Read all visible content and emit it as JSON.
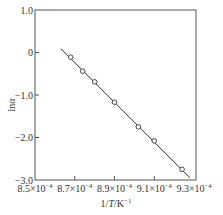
{
  "chart_data": {
    "type": "scatter",
    "title": "",
    "xlabel": "1/T/K⁻¹",
    "ylabel": "lnα",
    "xlim": [
      0.00085,
      0.00093
    ],
    "ylim": [
      -3.0,
      1.0
    ],
    "grid": false,
    "legend": null,
    "x_ticks": [
      0.00085,
      0.00087,
      0.00089,
      0.00091,
      0.00093
    ],
    "x_tick_labels": [
      "8.5×10⁻⁴",
      "8.7×10⁻⁴",
      "8.9×10⁻⁴",
      "9.1×10⁻⁴",
      "9.3×10⁻⁴"
    ],
    "y_ticks": [
      1.0,
      0,
      -1.0,
      -2.0,
      -3.0
    ],
    "y_tick_labels": [
      "1.0",
      "0",
      "−1.0",
      "−2.0",
      "−3.0"
    ],
    "series": [
      {
        "name": "data",
        "marker": "open-circle",
        "x": [
          0.000868,
          0.000874,
          0.00088,
          0.00089,
          0.000902,
          0.00091,
          0.000924
        ],
        "y": [
          -0.11,
          -0.44,
          -0.69,
          -1.17,
          -1.75,
          -2.08,
          -2.75
        ]
      },
      {
        "name": "linear fit",
        "type": "line",
        "x": [
          0.000863,
          0.000928
        ],
        "y": [
          0.09,
          -2.95
        ]
      }
    ]
  },
  "labels": {
    "xlabel_main": "1/",
    "xlabel_T": "T",
    "xlabel_unit": "/K",
    "xlabel_sup": "−1",
    "ylabel_ln": "ln",
    "ylabel_alpha": "α"
  }
}
